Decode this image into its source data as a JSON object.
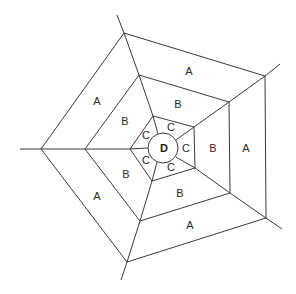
{
  "diagram": {
    "center_label": "D",
    "zones": {
      "outer": "A",
      "middle": "B",
      "inner": "C",
      "core": "D"
    },
    "labels": {
      "a_top": "A",
      "a_right": "A",
      "a_bottom": "A",
      "a_lower_left": "A",
      "a_upper_left": "A",
      "b_top": "B",
      "b_right": "B",
      "b_bottom": "B",
      "b_lower_left": "B",
      "b_upper_left": "B",
      "c_top": "C",
      "c_right": "C",
      "c_bottom": "C",
      "c_lower_left": "C",
      "c_upper_left": "C",
      "d_center": "D"
    },
    "colors": {
      "line": "#3a3a3a",
      "text": "#2a2a2a",
      "background": "#ffffff"
    }
  }
}
